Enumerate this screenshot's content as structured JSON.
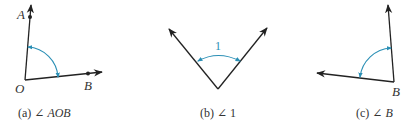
{
  "colors": {
    "ray": "#222222",
    "arc": "#2a8fb5",
    "text": "#333333"
  },
  "figures": [
    {
      "id": "a",
      "caption_prefix": "(a) ∠ ",
      "caption_name": "AOB",
      "points": {
        "A": "A",
        "O": "O",
        "B": "B"
      }
    },
    {
      "id": "b",
      "caption_prefix": "(b) ∠ ",
      "caption_name": "1",
      "angle_label": "1"
    },
    {
      "id": "c",
      "caption_prefix": "(c) ∠ ",
      "caption_name": "B",
      "points": {
        "B": "B"
      }
    }
  ]
}
